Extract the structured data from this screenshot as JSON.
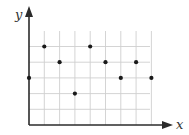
{
  "chart_data": {
    "type": "scatter",
    "title": "",
    "xlabel": "x",
    "ylabel": "y",
    "x": [
      0,
      1,
      2,
      3,
      4,
      5,
      6,
      7,
      8
    ],
    "y": [
      3,
      5,
      4,
      2,
      5,
      4,
      3,
      4,
      3
    ],
    "points": [
      {
        "x": 0,
        "y": 3
      },
      {
        "x": 1,
        "y": 5
      },
      {
        "x": 2,
        "y": 4
      },
      {
        "x": 3,
        "y": 2
      },
      {
        "x": 4,
        "y": 5
      },
      {
        "x": 5,
        "y": 4
      },
      {
        "x": 6,
        "y": 3
      },
      {
        "x": 7,
        "y": 4
      },
      {
        "x": 8,
        "y": 3
      }
    ],
    "xlim": [
      0,
      8
    ],
    "ylim": [
      0,
      6
    ],
    "grid": true,
    "tick_labels": false,
    "colors": {
      "axis": "#2b2b2b",
      "grid": "#cfcfcf",
      "point": "#1a1a1a"
    }
  }
}
